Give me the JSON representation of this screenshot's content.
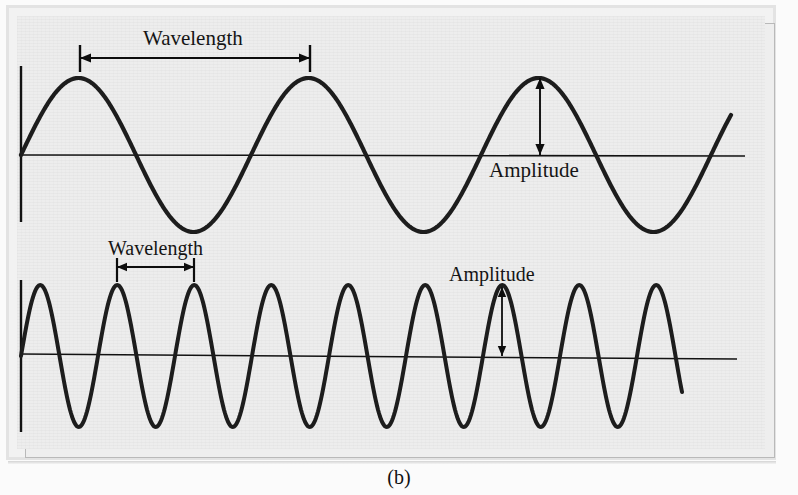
{
  "figure": {
    "caption": "(b)",
    "colors": {
      "wave_stroke": "#1d1d1d",
      "axis_stroke": "#121212",
      "annotation_stroke": "#0d0d0d",
      "plot_background": "#ededed",
      "frame_border": "#b9b9b9",
      "page_background": "#fbfbfb",
      "text": "#151515"
    },
    "labels": {
      "wavelength_top": "Wavelength",
      "amplitude_top": "Amplitude",
      "wavelength_bottom": "Wavelength",
      "amplitude_bottom": "Amplitude"
    }
  },
  "chart_data": {
    "type": "line",
    "title": "",
    "subtitle": "",
    "xlabel": "",
    "ylabel": "",
    "grid": false,
    "legend": "none",
    "axes": [
      {
        "name": "top-wave-axes",
        "baseline_y_px": 155,
        "y_axis_x_px": 21,
        "y_axis_top_px": 66,
        "y_axis_bottom_px": 222,
        "baseline_x_start_px": 21,
        "baseline_x_end_px": 745
      },
      {
        "name": "bottom-wave-axes",
        "baseline_y_px": 356,
        "y_axis_x_px": 21,
        "y_axis_top_px": 280,
        "y_axis_bottom_px": 432,
        "baseline_x_start_px": 21,
        "baseline_x_end_px": 737
      }
    ],
    "series": [
      {
        "name": "long-wavelength-wave",
        "wavelength_px": 230,
        "amplitude_px": 77,
        "phase_deg": 0,
        "x_start_px": 21,
        "x_end_px": 731,
        "cycles": 3.08,
        "peaks_x_px": [
          80,
          310,
          540
        ],
        "troughs_x_px": [
          195,
          425,
          655
        ],
        "zero_crossings_x_px": [
          21,
          137,
          252,
          367,
          482,
          597,
          712
        ]
      },
      {
        "name": "short-wavelength-wave",
        "wavelength_px": 77,
        "amplitude_px": 71,
        "phase_deg": 0,
        "x_start_px": 21,
        "x_end_px": 682,
        "cycles": 8.6,
        "peaks_x_px": [
          40,
          117,
          194,
          271,
          348,
          425,
          502,
          579,
          656
        ],
        "troughs_x_px": [
          78,
          155,
          232,
          309,
          386,
          463,
          540,
          617
        ],
        "zero_crossings_x_px": [
          21,
          59,
          97,
          136,
          175,
          213,
          252,
          290,
          329,
          367,
          406,
          444,
          483,
          521,
          560,
          598,
          637,
          675
        ]
      }
    ],
    "annotations": [
      {
        "kind": "wavelength-span",
        "target_series": "long-wavelength-wave",
        "label": "Wavelength",
        "x_from_px": 80,
        "x_to_px": 310,
        "arrow_y_px": 58,
        "tick_top_px": 45,
        "tick_bottom_px": 72,
        "value_px": 230
      },
      {
        "kind": "amplitude-span",
        "target_series": "long-wavelength-wave",
        "label": "Amplitude",
        "x_px": 540,
        "y_from_px": 78,
        "y_to_px": 155,
        "value_px": 77
      },
      {
        "kind": "wavelength-span",
        "target_series": "short-wavelength-wave",
        "label": "Wavelength",
        "x_from_px": 117,
        "x_to_px": 194,
        "arrow_y_px": 267,
        "tick_top_px": 258,
        "tick_bottom_px": 282,
        "value_px": 77
      },
      {
        "kind": "amplitude-span",
        "target_series": "short-wavelength-wave",
        "label": "Amplitude",
        "x_px": 502,
        "y_from_px": 287,
        "y_to_px": 356,
        "value_px": 69
      }
    ]
  }
}
